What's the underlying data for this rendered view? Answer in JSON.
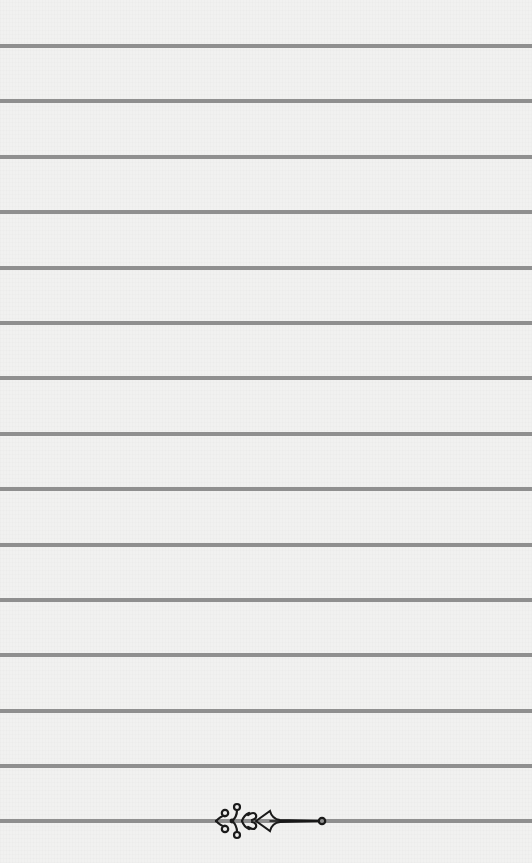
{
  "page": {
    "type": "lined-paper",
    "background_color": "#f1f1f0",
    "line_color": "#8f8f8f",
    "line_thickness_px": 4,
    "line_positions_y": [
      44,
      99,
      155,
      210,
      266,
      321,
      376,
      432,
      487,
      543,
      598,
      653,
      709,
      764,
      819
    ]
  },
  "ornament": {
    "icon": "scroll-flourish-icon",
    "color": "#1a1a1a"
  }
}
